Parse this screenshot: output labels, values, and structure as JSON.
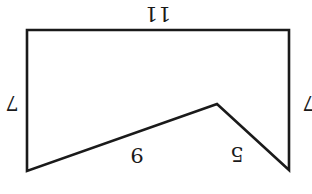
{
  "diagram": {
    "type": "polygon-perimeter",
    "orientation": "rotated 180 degrees",
    "stroke_color": "#1a1a1a",
    "background": "#ffffff",
    "vertices": [
      [
        27,
        30
      ],
      [
        289,
        30
      ],
      [
        289,
        170
      ],
      [
        217,
        104
      ],
      [
        27,
        171
      ]
    ],
    "labels": {
      "top": "11",
      "left": "7",
      "right": "7",
      "slant_long": "9",
      "slant_short": "5"
    }
  }
}
